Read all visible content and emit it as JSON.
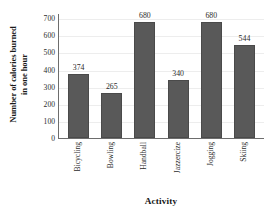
{
  "chart_data": {
    "type": "bar",
    "title": "",
    "xlabel": "Activity",
    "ylabel": "Number of calories burned in one hour",
    "ylabel_line1": "Number of calories burned",
    "ylabel_line2": "in one hour",
    "categories": [
      "Bicycling",
      "Bowling",
      "Handball",
      "Jazzercize",
      "Jogging",
      "Skiing"
    ],
    "values": [
      374,
      265,
      680,
      340,
      680,
      544
    ],
    "value_labels": [
      "374",
      "265",
      "680",
      "340",
      "680",
      "544"
    ],
    "ylim": [
      0,
      730
    ],
    "yticks": [
      0,
      100,
      200,
      300,
      400,
      500,
      600,
      700
    ],
    "ytick_labels": [
      "0",
      "100",
      "200",
      "300",
      "400",
      "500",
      "600",
      "700"
    ],
    "grid": true,
    "legend": "none",
    "bar_color": "#595959",
    "grid_color": "#ededed",
    "axis_color": "#6d6d6d",
    "background_color": "#ffffff",
    "text_color": "#2b2b2b"
  }
}
